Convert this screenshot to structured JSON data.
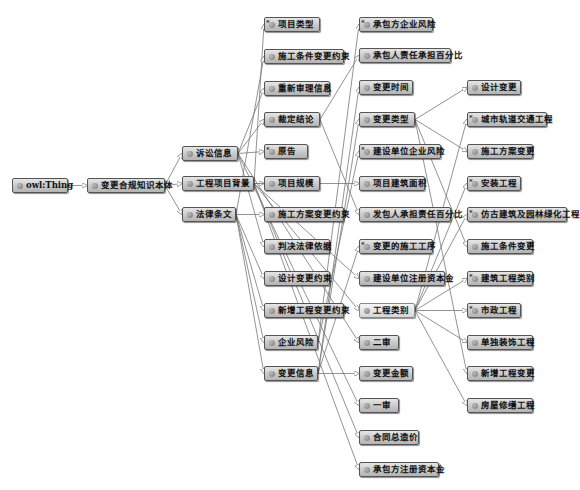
{
  "diagram": {
    "type": "OWL class hierarchy graph",
    "colors": {
      "node_fill": "#c8c8c8",
      "node_border": "#555555",
      "edge": "#777777",
      "selected_fill": "#e4e4e4"
    },
    "nodes": [
      {
        "id": "owl_thing",
        "label": "owl:Thing",
        "x": 12,
        "y": 178,
        "w": 56,
        "star": false
      },
      {
        "id": "root",
        "label": "变更合规知识本体",
        "x": 87,
        "y": 178,
        "w": 78,
        "star": false
      },
      {
        "id": "lawsuit",
        "label": "诉讼信息",
        "x": 182,
        "y": 146,
        "w": 56,
        "star": false
      },
      {
        "id": "project_bg",
        "label": "工程项目背景",
        "x": 182,
        "y": 176,
        "w": 72,
        "star": false
      },
      {
        "id": "law",
        "label": "法律条文",
        "x": 182,
        "y": 207,
        "w": 54,
        "star": false
      },
      {
        "id": "proj_type",
        "label": "项目类型",
        "x": 264,
        "y": 17,
        "w": 56,
        "star": true
      },
      {
        "id": "cond_constraint",
        "label": "施工条件变更约束",
        "x": 264,
        "y": 49,
        "w": 80,
        "star": false
      },
      {
        "id": "retrial",
        "label": "重新审理信息",
        "x": 264,
        "y": 81,
        "w": 66,
        "star": false
      },
      {
        "id": "verdict",
        "label": "裁定结论",
        "x": 264,
        "y": 112,
        "w": 56,
        "star": false
      },
      {
        "id": "plaintiff",
        "label": "原告",
        "x": 264,
        "y": 144,
        "w": 44,
        "star": true
      },
      {
        "id": "proj_scale",
        "label": "项目规模",
        "x": 264,
        "y": 176,
        "w": 56,
        "star": false
      },
      {
        "id": "plan_constraint",
        "label": "施工方案变更约束",
        "x": 264,
        "y": 207,
        "w": 80,
        "star": false
      },
      {
        "id": "legal_basis",
        "label": "判决法律依据",
        "x": 264,
        "y": 239,
        "w": 66,
        "star": false
      },
      {
        "id": "design_constraint",
        "label": "设计变更约束",
        "x": 264,
        "y": 271,
        "w": 66,
        "star": false
      },
      {
        "id": "new_constraint",
        "label": "新增工程变更约束",
        "x": 264,
        "y": 303,
        "w": 80,
        "star": false
      },
      {
        "id": "ent_risk",
        "label": "企业风险",
        "x": 264,
        "y": 335,
        "w": 54,
        "star": false
      },
      {
        "id": "change_info",
        "label": "变更信息",
        "x": 264,
        "y": 366,
        "w": 54,
        "star": false
      },
      {
        "id": "contractor_risk",
        "label": "承包方企业风险",
        "x": 359,
        "y": 17,
        "w": 74,
        "star": true
      },
      {
        "id": "contractor_pct",
        "label": "承包人责任承担百分比",
        "x": 359,
        "y": 48,
        "w": 92,
        "star": false
      },
      {
        "id": "change_time",
        "label": "变更时间",
        "x": 359,
        "y": 80,
        "w": 54,
        "star": false
      },
      {
        "id": "change_type",
        "label": "变更类型",
        "x": 359,
        "y": 112,
        "w": 56,
        "star": false
      },
      {
        "id": "owner_risk",
        "label": "建设单位企业风险",
        "x": 359,
        "y": 144,
        "w": 82,
        "star": true
      },
      {
        "id": "build_area",
        "label": "项目建筑面积",
        "x": 359,
        "y": 176,
        "w": 66,
        "star": false
      },
      {
        "id": "employer_pct",
        "label": "发包人承担责任百分比",
        "x": 359,
        "y": 207,
        "w": 92,
        "star": false
      },
      {
        "id": "changed_process",
        "label": "变更的施工工序",
        "x": 359,
        "y": 239,
        "w": 74,
        "star": true
      },
      {
        "id": "owner_capital",
        "label": "建设单位注册资本金",
        "x": 359,
        "y": 271,
        "w": 86,
        "star": false
      },
      {
        "id": "proj_category",
        "label": "工程类别",
        "x": 359,
        "y": 303,
        "w": 56,
        "star": false,
        "selected": true
      },
      {
        "id": "second_trial",
        "label": "二审",
        "x": 359,
        "y": 335,
        "w": 40,
        "star": false
      },
      {
        "id": "change_amount",
        "label": "变更金额",
        "x": 359,
        "y": 366,
        "w": 54,
        "star": false
      },
      {
        "id": "first_trial",
        "label": "一审",
        "x": 359,
        "y": 398,
        "w": 40,
        "star": false
      },
      {
        "id": "contract_price",
        "label": "合同总造价",
        "x": 359,
        "y": 430,
        "w": 60,
        "star": false
      },
      {
        "id": "contractor_capital",
        "label": "承包方注册资本金",
        "x": 359,
        "y": 462,
        "w": 80,
        "star": false
      },
      {
        "id": "design_change",
        "label": "设计变更",
        "x": 467,
        "y": 80,
        "w": 54,
        "star": false
      },
      {
        "id": "rail_transit",
        "label": "城市轨道交通工程",
        "x": 467,
        "y": 112,
        "w": 80,
        "star": true
      },
      {
        "id": "plan_change",
        "label": "施工方案变更",
        "x": 467,
        "y": 144,
        "w": 66,
        "star": false
      },
      {
        "id": "install",
        "label": "安装工程",
        "x": 467,
        "y": 176,
        "w": 54,
        "star": true
      },
      {
        "id": "landscape",
        "label": "仿古建筑及园林绿化工程",
        "x": 467,
        "y": 207,
        "w": 100,
        "star": true
      },
      {
        "id": "cond_change",
        "label": "施工条件变更",
        "x": 467,
        "y": 239,
        "w": 66,
        "star": false
      },
      {
        "id": "build_category",
        "label": "建筑工程类别",
        "x": 467,
        "y": 271,
        "w": 66,
        "star": true
      },
      {
        "id": "municipal",
        "label": "市政工程",
        "x": 467,
        "y": 303,
        "w": 54,
        "star": true
      },
      {
        "id": "decoration",
        "label": "单独装饰工程",
        "x": 467,
        "y": 335,
        "w": 66,
        "star": false
      },
      {
        "id": "new_change",
        "label": "新增工程变更",
        "x": 467,
        "y": 366,
        "w": 66,
        "star": false
      },
      {
        "id": "renovation",
        "label": "房屋修缮工程",
        "x": 467,
        "y": 398,
        "w": 66,
        "star": false
      }
    ],
    "edges": [
      [
        "owl_thing",
        "root"
      ],
      [
        "root",
        "lawsuit"
      ],
      [
        "root",
        "project_bg"
      ],
      [
        "root",
        "law"
      ],
      [
        "lawsuit",
        "verdict"
      ],
      [
        "lawsuit",
        "plaintiff"
      ],
      [
        "lawsuit",
        "retrial"
      ],
      [
        "lawsuit",
        "legal_basis"
      ],
      [
        "lawsuit",
        "first_trial"
      ],
      [
        "lawsuit",
        "second_trial"
      ],
      [
        "project_bg",
        "proj_type"
      ],
      [
        "project_bg",
        "proj_scale"
      ],
      [
        "project_bg",
        "build_area"
      ],
      [
        "project_bg",
        "contract_price"
      ],
      [
        "project_bg",
        "proj_category"
      ],
      [
        "project_bg",
        "contractor_capital"
      ],
      [
        "project_bg",
        "owner_capital"
      ],
      [
        "law",
        "cond_constraint"
      ],
      [
        "law",
        "plan_constraint"
      ],
      [
        "law",
        "design_constraint"
      ],
      [
        "law",
        "new_constraint"
      ],
      [
        "law",
        "ent_risk"
      ],
      [
        "law",
        "change_info"
      ],
      [
        "change_info",
        "change_time"
      ],
      [
        "change_info",
        "change_type"
      ],
      [
        "change_info",
        "change_amount"
      ],
      [
        "change_info",
        "changed_process"
      ],
      [
        "ent_risk",
        "contractor_risk"
      ],
      [
        "ent_risk",
        "owner_risk"
      ],
      [
        "verdict",
        "contractor_pct"
      ],
      [
        "verdict",
        "employer_pct"
      ],
      [
        "change_type",
        "design_change"
      ],
      [
        "change_type",
        "plan_change"
      ],
      [
        "change_type",
        "cond_change"
      ],
      [
        "change_type",
        "new_change"
      ],
      [
        "proj_category",
        "rail_transit"
      ],
      [
        "proj_category",
        "install"
      ],
      [
        "proj_category",
        "landscape"
      ],
      [
        "proj_category",
        "build_category"
      ],
      [
        "proj_category",
        "municipal"
      ],
      [
        "proj_category",
        "decoration"
      ],
      [
        "proj_category",
        "renovation"
      ]
    ]
  }
}
